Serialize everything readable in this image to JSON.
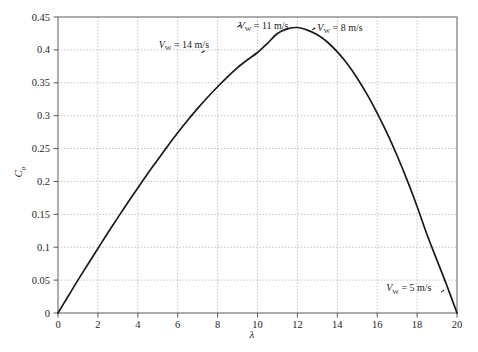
{
  "chart_data": {
    "type": "line",
    "title": "",
    "xlabel": "λ",
    "ylabel": "C_p",
    "xlim": [
      0,
      20
    ],
    "ylim": [
      0,
      0.45
    ],
    "grid": true,
    "legend_position": "none",
    "xticks": [
      "0",
      "2",
      "4",
      "6",
      "8",
      "10",
      "12",
      "14",
      "16",
      "18",
      "20"
    ],
    "xtick_values": [
      0,
      2,
      4,
      6,
      8,
      10,
      12,
      14,
      16,
      18,
      20
    ],
    "yticks": [
      "0",
      "0.05",
      "0.1",
      "0.15",
      "0.2",
      "0.25",
      "0.3",
      "0.35",
      "0.4",
      "0.45"
    ],
    "ytick_values": [
      0,
      0.05,
      0.1,
      0.15,
      0.2,
      0.25,
      0.3,
      0.35,
      0.4,
      0.45
    ],
    "series": [
      {
        "name": "Cp curve",
        "color": "#1a1a1a",
        "x": [
          0,
          0.5,
          1,
          1.5,
          2,
          2.5,
          3,
          3.5,
          4,
          4.5,
          5,
          5.5,
          6,
          6.5,
          7,
          7.5,
          8,
          8.5,
          9,
          9.5,
          10,
          10.5,
          11,
          11.5,
          12,
          12.5,
          13,
          13.5,
          14,
          14.5,
          15,
          15.5,
          16,
          16.5,
          17,
          17.5,
          18,
          18.5,
          19,
          19.5,
          20
        ],
        "y": [
          0,
          0.025,
          0.05,
          0.074,
          0.098,
          0.122,
          0.145,
          0.168,
          0.19,
          0.212,
          0.233,
          0.254,
          0.274,
          0.293,
          0.311,
          0.328,
          0.344,
          0.359,
          0.373,
          0.385,
          0.396,
          0.41,
          0.425,
          0.432,
          0.434,
          0.43,
          0.423,
          0.412,
          0.397,
          0.379,
          0.357,
          0.332,
          0.304,
          0.273,
          0.239,
          0.202,
          0.162,
          0.119,
          0.08,
          0.041,
          0
        ]
      }
    ],
    "annotations": [
      {
        "id": "vw-14",
        "text_var": "V",
        "text_sub": "W",
        "text_rest": " = 14 m/s",
        "full_text": "V_W = 14 m/s",
        "label_x": 5.05,
        "label_y": 0.408,
        "pointer_x": 7.35,
        "pointer_y": 0.398
      },
      {
        "id": "vw-11",
        "text_var": "V",
        "text_sub": "W",
        "text_rest": " = 11 m/s",
        "full_text": "V_W = 11 m/s",
        "label_x": 9.05,
        "label_y": 0.437,
        "pointer_x": 9.15,
        "pointer_y": 0.437
      },
      {
        "id": "vw-8",
        "text_var": "V",
        "text_sub": "W",
        "text_rest": " = 8 m/s",
        "full_text": "V_W = 8 m/s",
        "label_x": 13.0,
        "label_y": 0.434,
        "pointer_x": 12.9,
        "pointer_y": 0.433
      },
      {
        "id": "vw-5",
        "text_var": "V",
        "text_sub": "W",
        "text_rest": " = 5 m/s",
        "full_text": "V_W = 5 m/s",
        "label_x": 16.45,
        "label_y": 0.038,
        "pointer_x": 19.35,
        "pointer_y": 0.034
      }
    ],
    "colors": {
      "curve": "#1a1a1a",
      "axis": "#595959",
      "grid": "#b3b3b3",
      "background": "#ffffff",
      "text": "#1a1a1a"
    }
  }
}
